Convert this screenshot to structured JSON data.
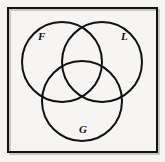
{
  "figure": {
    "kind": "venn-diagram",
    "background_color": "#f6f5f3",
    "stroke_color": "#111111",
    "universe": {
      "name": "universal-set-rectangle",
      "x": 8,
      "y": 8,
      "width": 149,
      "height": 144,
      "stroke_width": 2
    },
    "circles": [
      {
        "id": "F",
        "label": "F",
        "name": "circle-f",
        "cx": 62,
        "cy": 62,
        "r": 40,
        "stroke_width": 2,
        "fill": "none"
      },
      {
        "id": "L",
        "label": "L",
        "name": "circle-l",
        "cx": 102,
        "cy": 62,
        "r": 40,
        "stroke_width": 2,
        "fill": "none"
      },
      {
        "id": "G",
        "label": "G",
        "name": "circle-g",
        "cx": 82,
        "cy": 101,
        "r": 40,
        "stroke_width": 2,
        "fill": "none"
      }
    ],
    "labels": [
      {
        "text": "F",
        "x": 38,
        "y": 31,
        "font_size": 11
      },
      {
        "text": "L",
        "x": 121,
        "y": 31,
        "font_size": 11
      },
      {
        "text": "G",
        "x": 79,
        "y": 124,
        "font_size": 11
      }
    ]
  }
}
